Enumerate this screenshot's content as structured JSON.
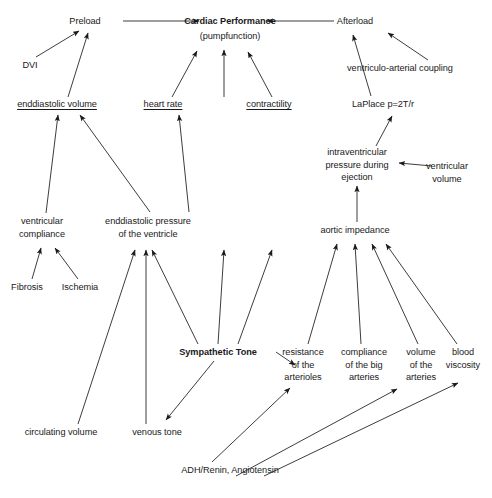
{
  "diagram": {
    "nodes": [
      {
        "id": "preload",
        "label": "Preload",
        "x": 85,
        "y": 21,
        "w": 70,
        "bold": false,
        "underline": false
      },
      {
        "id": "cardiac",
        "label": "Cardiac Performance",
        "x": 230,
        "y": 21,
        "w": 130,
        "bold": true,
        "underline": false
      },
      {
        "id": "pumpfunction",
        "label": "(pumpfunction)",
        "x": 230,
        "y": 36,
        "w": 120,
        "bold": false,
        "underline": false
      },
      {
        "id": "afterload",
        "label": "Afterload",
        "x": 355,
        "y": 21,
        "w": 70,
        "bold": false,
        "underline": false
      },
      {
        "id": "dvi",
        "label": "DVI",
        "x": 30,
        "y": 65,
        "w": 40,
        "bold": false,
        "underline": false
      },
      {
        "id": "vac",
        "label": "ventriculo-arterial coupling",
        "x": 400,
        "y": 68,
        "w": 180,
        "bold": false,
        "underline": false
      },
      {
        "id": "edv",
        "label": "enddiastolic volume",
        "x": 57,
        "y": 104,
        "w": 110,
        "bold": false,
        "underline": true
      },
      {
        "id": "hr",
        "label": "heart rate",
        "x": 163,
        "y": 104,
        "w": 70,
        "bold": false,
        "underline": true
      },
      {
        "id": "contractility",
        "label": "contractility",
        "x": 269,
        "y": 104,
        "w": 75,
        "bold": false,
        "underline": true
      },
      {
        "id": "laplace",
        "label": "LaPlace p=2T/r",
        "x": 383,
        "y": 104,
        "w": 100,
        "bold": false,
        "underline": false
      },
      {
        "id": "ivp",
        "label": "intraventricular\npressure during\nejection",
        "x": 357,
        "y": 152,
        "w": 100,
        "bold": false,
        "underline": false
      },
      {
        "id": "ventvol",
        "label": "ventricular\nvolume",
        "x": 447,
        "y": 166,
        "w": 80,
        "bold": false,
        "underline": false
      },
      {
        "id": "vcompliance",
        "label": "ventricular\ncompliance",
        "x": 42,
        "y": 221,
        "w": 80,
        "bold": false,
        "underline": false
      },
      {
        "id": "edp",
        "label": "enddiastolic pressure\nof the ventricle",
        "x": 148,
        "y": 221,
        "w": 120,
        "bold": false,
        "underline": false
      },
      {
        "id": "aortimp",
        "label": "aortic impedance",
        "x": 355,
        "y": 230,
        "w": 110,
        "bold": false,
        "underline": false
      },
      {
        "id": "fibrosis",
        "label": "Fibrosis",
        "x": 27,
        "y": 287,
        "w": 55,
        "bold": false,
        "underline": false
      },
      {
        "id": "ischemia",
        "label": "Ischemia",
        "x": 80,
        "y": 287,
        "w": 60,
        "bold": false,
        "underline": false
      },
      {
        "id": "symptone",
        "label": "Sympathetic Tone",
        "x": 218,
        "y": 352,
        "w": 110,
        "bold": true,
        "underline": false
      },
      {
        "id": "resistance",
        "label": "resistance\nof the\narterioles",
        "x": 303,
        "y": 352,
        "w": 70,
        "bold": false,
        "underline": false
      },
      {
        "id": "compliance",
        "label": "compliance\nof the big\narteries",
        "x": 364,
        "y": 352,
        "w": 72,
        "bold": false,
        "underline": false
      },
      {
        "id": "volarteries",
        "label": "volume\nof the\narteries",
        "x": 421,
        "y": 352,
        "w": 60,
        "bold": false,
        "underline": false
      },
      {
        "id": "viscosity",
        "label": "blood\nviscosity",
        "x": 463,
        "y": 352,
        "w": 58,
        "bold": false,
        "underline": false
      },
      {
        "id": "circvol",
        "label": "circulating volume",
        "x": 61,
        "y": 432,
        "w": 105,
        "bold": false,
        "underline": false
      },
      {
        "id": "venoustone",
        "label": "venous tone",
        "x": 157,
        "y": 432,
        "w": 75,
        "bold": false,
        "underline": false
      },
      {
        "id": "adh",
        "label": "ADH/Renin, Angiotensin",
        "x": 230,
        "y": 470,
        "w": 130,
        "bold": false,
        "underline": false
      }
    ],
    "edges": [
      {
        "from": "preload",
        "to": "cardiac",
        "path": "M123,21 L199,21"
      },
      {
        "from": "afterload",
        "to": "cardiac",
        "path": "M334,21 L267,21"
      },
      {
        "from": "dvi",
        "to": "preload",
        "path": "M36,57 L79,31"
      },
      {
        "from": "edv",
        "to": "preload",
        "path": "M68,97 L88,33"
      },
      {
        "from": "hr",
        "to": "cardiac",
        "path": "M172,97 L197,51"
      },
      {
        "from": "contractility",
        "to": "cardiac",
        "path": "M272,97 L248,52"
      },
      {
        "from": "pumpline",
        "to": "cardiac",
        "path": "M224,97 L224,50"
      },
      {
        "from": "laplace",
        "to": "afterload",
        "path": "M371,96 L353,35"
      },
      {
        "from": "vac",
        "to": "afterload",
        "path": "M428,60 L388,33"
      },
      {
        "from": "ivp",
        "to": "laplace",
        "path": "M376,146 L392,116"
      },
      {
        "from": "ventvol",
        "to": "ivp",
        "path": "M432,166 L399,163"
      },
      {
        "from": "aortimp",
        "to": "ivp",
        "path": "M357,222 L357,186"
      },
      {
        "from": "vcompliance",
        "to": "edv",
        "path": "M46,213 L58,115"
      },
      {
        "from": "edp",
        "to": "edv",
        "path": "M150,212 L80,115"
      },
      {
        "from": "edp",
        "to": "hr2",
        "path": "M189,212 L179,115"
      },
      {
        "from": "fibrosis",
        "to": "vcompliance",
        "path": "M32,279 L41,248"
      },
      {
        "from": "ischemia",
        "to": "vcompliance",
        "path": "M78,279 L55,248"
      },
      {
        "from": "circvol",
        "to": "edp",
        "path": "M78,424 L135,250"
      },
      {
        "from": "venoustone",
        "to": "edp",
        "path": "M146,424 L146,250"
      },
      {
        "from": "symptone",
        "to": "edp",
        "path": "M198,344 L152,250"
      },
      {
        "from": "symptone",
        "to": "hr3",
        "path": "M218,344 L224,250"
      },
      {
        "from": "symptone",
        "to": "contract2",
        "path": "M238,344 L272,250"
      },
      {
        "from": "symptone",
        "to": "venoustone",
        "path": "M214,361 L166,420"
      },
      {
        "from": "symptone",
        "to": "resistance",
        "path": "M276,352 L295,365"
      },
      {
        "from": "resistance",
        "to": "aortimp",
        "path": "M308,344 L337,244"
      },
      {
        "from": "compliance",
        "to": "aortimp",
        "path": "M361,344 L355,244"
      },
      {
        "from": "volarteries",
        "to": "aortimp",
        "path": "M418,344 L372,244"
      },
      {
        "from": "viscosity",
        "to": "aortimp",
        "path": "M457,344 L386,244"
      },
      {
        "from": "adh",
        "to": "resistance",
        "path": "M212,462 L290,388"
      },
      {
        "from": "adh",
        "to": "volarteries",
        "path": "M236,476 L397,389"
      },
      {
        "from": "adh",
        "to": "viscosity",
        "path": "M264,476 L458,383"
      }
    ],
    "caption": ""
  }
}
